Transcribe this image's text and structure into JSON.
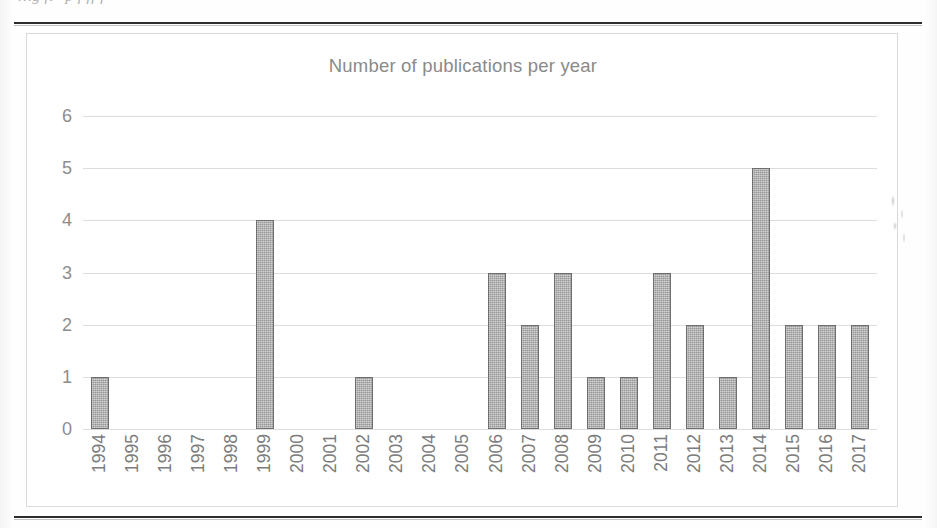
{
  "document": {
    "caption_partial": "…g                                     fi                            \"p  f                                            ff f"
  },
  "chart": {
    "title": "Number of publications per year",
    "grid_color": "#dcdcdc",
    "bar_fill": "#a6a6a6",
    "bar_border": "#6e6e6e",
    "label_color": "#8d8d8d"
  },
  "chart_data": {
    "type": "bar",
    "title": "Number of publications per year",
    "xlabel": "",
    "ylabel": "",
    "ylim": [
      0,
      6
    ],
    "ytick_labels": [
      "6",
      "5",
      "4",
      "3",
      "2",
      "1",
      "0"
    ],
    "ytick_values": [
      6,
      5,
      4,
      3,
      2,
      1,
      0
    ],
    "ystep": 1,
    "grid": true,
    "legend": "none",
    "xtick_rotation": -90,
    "categories": [
      "1994",
      "1995",
      "1996",
      "1997",
      "1998",
      "1999",
      "2000",
      "2001",
      "2002",
      "2003",
      "2004",
      "2005",
      "2006",
      "2007",
      "2008",
      "2009",
      "2010",
      "2011",
      "2012",
      "2013",
      "2014",
      "2015",
      "2016",
      "2017"
    ],
    "values": [
      1,
      0,
      0,
      0,
      0,
      4,
      0,
      0,
      1,
      0,
      0,
      0,
      3,
      2,
      3,
      1,
      1,
      3,
      2,
      1,
      5,
      2,
      2,
      2
    ],
    "total": 31
  }
}
